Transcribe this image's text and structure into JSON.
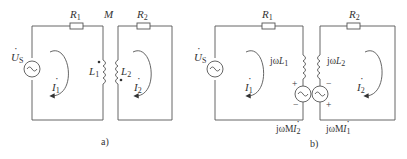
{
  "diagram_a": {
    "caption": "a)",
    "source": {
      "symbol": "U",
      "sub": "S",
      "type": "ac-voltage-source"
    },
    "resistor1": {
      "symbol": "R",
      "sub": "1"
    },
    "resistor2": {
      "symbol": "R",
      "sub": "2"
    },
    "mutual": "M",
    "inductor1": {
      "symbol": "L",
      "sub": "1"
    },
    "inductor2": {
      "symbol": "L",
      "sub": "2"
    },
    "current1": {
      "symbol": "I",
      "sub": "1"
    },
    "current2": {
      "symbol": "I",
      "sub": "2"
    }
  },
  "diagram_b": {
    "caption": "b)",
    "source": {
      "symbol": "U",
      "sub": "S",
      "type": "ac-voltage-source"
    },
    "resistor1": {
      "symbol": "R",
      "sub": "1"
    },
    "resistor2": {
      "symbol": "R",
      "sub": "2"
    },
    "inductor1": {
      "prefix": "jω",
      "symbol": "L",
      "sub": "1"
    },
    "inductor2": {
      "prefix": "jω",
      "symbol": "L",
      "sub": "2"
    },
    "dep_source1": {
      "prefix": "jωM",
      "symbol": "I",
      "sub": "2",
      "plus": "+",
      "minus": "−"
    },
    "dep_source2": {
      "prefix": "jωM",
      "symbol": "I",
      "sub": "1",
      "plus": "+",
      "minus": "−"
    },
    "current1": {
      "symbol": "I",
      "sub": "1"
    },
    "current2": {
      "symbol": "I",
      "sub": "2"
    }
  }
}
